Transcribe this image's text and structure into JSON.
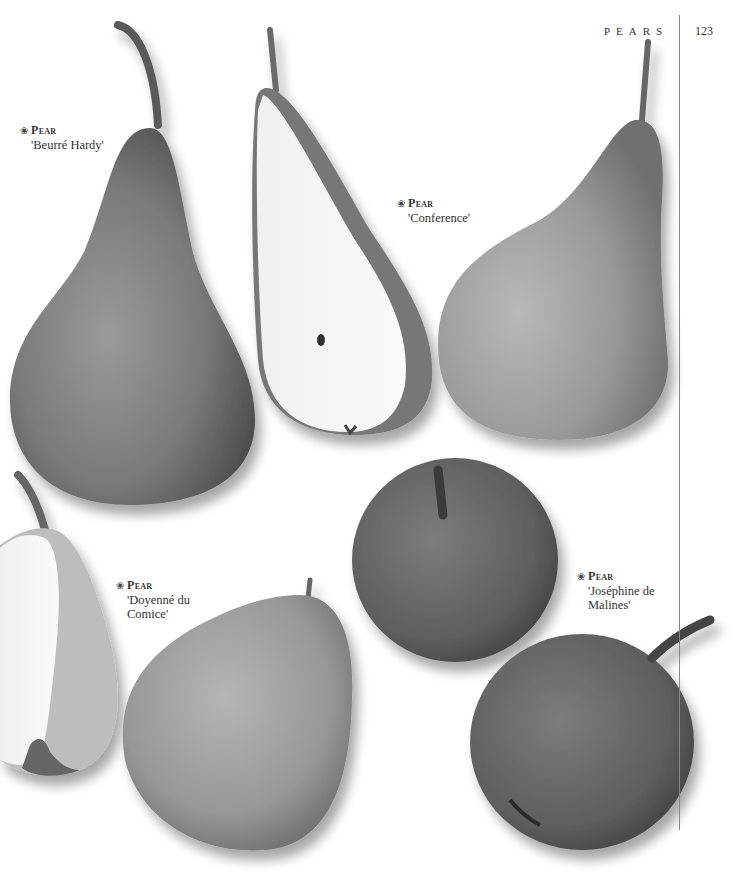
{
  "header": {
    "section_title": "PEARS",
    "page_number": "123"
  },
  "colors": {
    "background": "#ffffff",
    "rule": "#888888",
    "text": "#333333"
  },
  "entries": [
    {
      "icon": "flower-icon",
      "glyph": "❀",
      "kind": "Pear",
      "name": "'Beurré Hardy'"
    },
    {
      "icon": "flower-icon",
      "glyph": "❀",
      "kind": "Pear",
      "name": "'Conference'"
    },
    {
      "icon": "flower-icon",
      "glyph": "❀",
      "kind": "Pear",
      "name_line1": "'Doyenné du",
      "name_line2": "Comice'"
    },
    {
      "icon": "flower-icon",
      "glyph": "❀",
      "kind": "Pear",
      "name_line1": "'Joséphine de",
      "name_line2": "Malines'"
    }
  ],
  "images": [
    {
      "subject": "pear-beurre-hardy-whole"
    },
    {
      "subject": "pear-conference-halved"
    },
    {
      "subject": "pear-conference-whole"
    },
    {
      "subject": "pear-doyenne-du-comice-halved"
    },
    {
      "subject": "pear-doyenne-du-comice-whole"
    },
    {
      "subject": "pear-josephine-de-malines-top"
    },
    {
      "subject": "pear-josephine-de-malines-side"
    }
  ]
}
